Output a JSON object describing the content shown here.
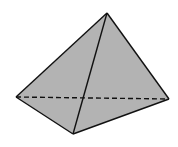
{
  "diagram": {
    "fill_color": "#b3b3b3",
    "stroke_color": "#111111",
    "background": "#ffffff",
    "vertices": {
      "apex": [
        107,
        13
      ],
      "left": [
        16,
        97
      ],
      "right": [
        169,
        99
      ],
      "front": [
        73,
        134
      ]
    },
    "edges": [
      {
        "from": "apex",
        "to": "left",
        "style": "solid"
      },
      {
        "from": "apex",
        "to": "right",
        "style": "solid"
      },
      {
        "from": "apex",
        "to": "front",
        "style": "solid"
      },
      {
        "from": "left",
        "to": "front",
        "style": "solid"
      },
      {
        "from": "front",
        "to": "right",
        "style": "solid"
      },
      {
        "from": "left",
        "to": "right",
        "style": "dashed"
      }
    ]
  }
}
